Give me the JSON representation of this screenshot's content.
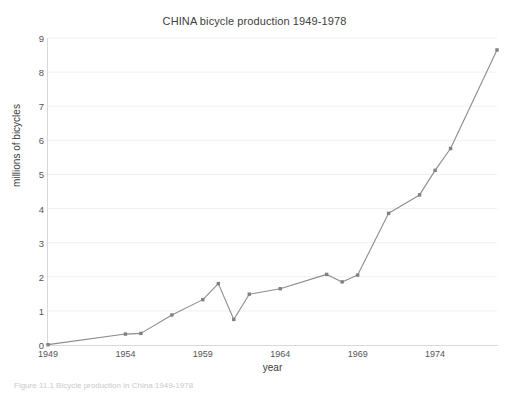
{
  "figure": {
    "caption": "Figure 11.1   Bicycle production in China 1949-1978"
  },
  "axis": {
    "x_title": "year",
    "y_title": "millions of bicycles",
    "x_ticks": [
      "1949",
      "1954",
      "1959",
      "1964",
      "1969",
      "1974"
    ],
    "y_ticks": [
      "0",
      "1",
      "2",
      "3",
      "4",
      "5",
      "6",
      "7",
      "8",
      "9"
    ]
  },
  "colors": {
    "line": "#8c8c8c",
    "marker": "#808080",
    "grid": "#f0f0f0",
    "axis": "#d9d9d9",
    "text": "#3b3b3b"
  },
  "chart_data": {
    "type": "line",
    "title": "CHINA bicycle production 1949-1978",
    "xlabel": "year",
    "ylabel": "millions of bicycles",
    "xlim": [
      1949,
      1978
    ],
    "ylim": [
      0,
      9
    ],
    "grid": true,
    "legend": "none",
    "x": [
      1949,
      1954,
      1955,
      1956,
      1957,
      1958,
      1959,
      1960,
      1961,
      1962,
      1963,
      1964,
      1965,
      1966,
      1967,
      1968,
      1969,
      1970,
      1971,
      1972,
      1973,
      1974,
      1975,
      1976,
      1977,
      1978
    ],
    "series": [
      {
        "name": "bicycle production",
        "values": [
          0.01,
          0.32,
          0.34,
          0.88,
          1.33,
          1.8,
          0.75,
          1.49,
          1.49,
          1.65,
          1.65,
          1.85,
          2.07,
          1.85,
          2.05,
          2.05,
          3.86,
          3.86,
          4.4,
          4.4,
          5.12,
          5.76,
          5.76,
          8.65,
          8.65,
          8.65
        ]
      }
    ],
    "points": [
      {
        "year": 1949,
        "value": 0.01
      },
      {
        "year": 1954,
        "value": 0.32
      },
      {
        "year": 1955,
        "value": 0.34
      },
      {
        "year": 1957,
        "value": 0.88
      },
      {
        "year": 1959,
        "value": 1.33
      },
      {
        "year": 1960,
        "value": 1.8
      },
      {
        "year": 1961,
        "value": 0.75
      },
      {
        "year": 1962,
        "value": 1.49
      },
      {
        "year": 1964,
        "value": 1.65
      },
      {
        "year": 1967,
        "value": 2.07
      },
      {
        "year": 1968,
        "value": 1.85
      },
      {
        "year": 1969,
        "value": 2.05
      },
      {
        "year": 1971,
        "value": 3.86
      },
      {
        "year": 1973,
        "value": 4.4
      },
      {
        "year": 1974,
        "value": 5.12
      },
      {
        "year": 1975,
        "value": 5.76
      },
      {
        "year": 1978,
        "value": 8.65
      }
    ]
  }
}
